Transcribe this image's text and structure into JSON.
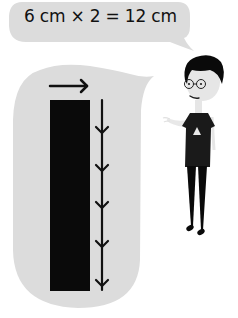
{
  "equation_bubble": {
    "text": "6 cm × 2 = 12 cm",
    "fill": "#dcdcdc"
  },
  "diagram_bubble": {
    "fill": "#dcdcdc",
    "bar": {
      "fill": "#0a0a0a",
      "width_arrow": "right-arrow-icon",
      "length_arrow_segments": 5
    }
  },
  "character": {
    "hair_color": "#0a0a0a",
    "skin_color": "#e6e6e6",
    "shirt_color": "#1a1a1a",
    "shirt_emblem": "triangle-icon",
    "eyewear": "glasses-icon"
  }
}
